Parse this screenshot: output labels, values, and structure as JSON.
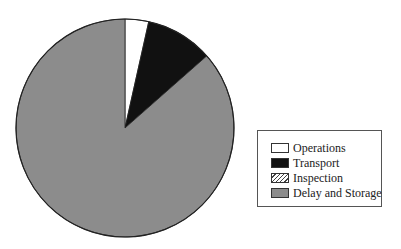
{
  "chart_data": {
    "type": "pie",
    "title": "",
    "categories": [
      "Operations",
      "Transport",
      "Inspection",
      "Delay and Storage"
    ],
    "values": [
      3.5,
      10,
      0,
      86.5
    ],
    "unit": "percent (estimated from slice angles)",
    "start_angle_deg": 0,
    "direction": "clockwise",
    "colors": [
      "#ffffff",
      "#111111",
      "hatched",
      "#8c8c8c"
    ],
    "legend_position": "right",
    "grid": false
  },
  "legend": {
    "items": [
      {
        "label": "Operations",
        "fill": "#ffffff"
      },
      {
        "label": "Transport",
        "fill": "#111111"
      },
      {
        "label": "Inspection",
        "fill": "hatched"
      },
      {
        "label": "Delay and Storage",
        "fill": "#8c8c8c"
      }
    ]
  }
}
